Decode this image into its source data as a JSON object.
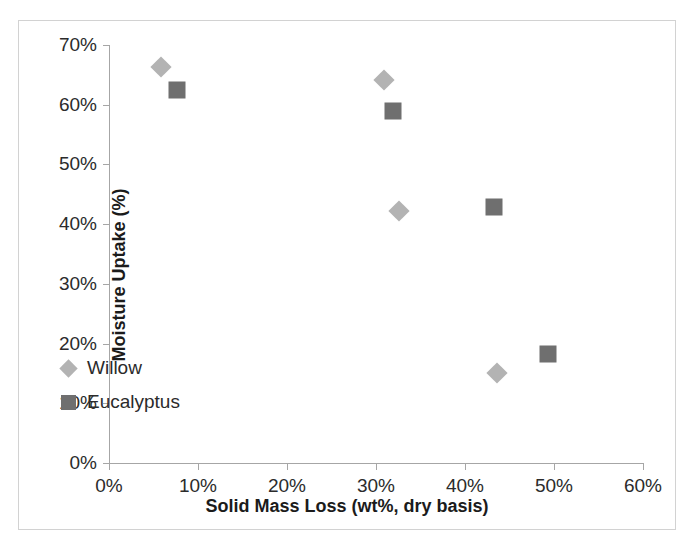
{
  "chart_data": {
    "type": "scatter",
    "title": "",
    "xlabel": "Solid Mass Loss (wt%, dry basis)",
    "ylabel": "Moisture Uptake (%)",
    "xlim": [
      0,
      60
    ],
    "ylim": [
      0,
      70
    ],
    "xticks": [
      "0%",
      "10%",
      "20%",
      "30%",
      "40%",
      "50%",
      "60%"
    ],
    "yticks": [
      "0%",
      "10%",
      "20%",
      "30%",
      "40%",
      "50%",
      "60%",
      "70%"
    ],
    "xtick_values": [
      0,
      10,
      20,
      30,
      40,
      50,
      60
    ],
    "ytick_values": [
      0,
      10,
      20,
      30,
      40,
      50,
      60,
      70
    ],
    "grid": false,
    "legend_position": "inside-lower-left",
    "series": [
      {
        "name": "Willow",
        "marker": "diamond",
        "color": "#b3b3b3",
        "points": [
          {
            "x": 5.8,
            "y": 66.3
          },
          {
            "x": 30.9,
            "y": 64.2
          },
          {
            "x": 32.6,
            "y": 42.2
          },
          {
            "x": 43.6,
            "y": 15.1
          }
        ]
      },
      {
        "name": "Eucalyptus",
        "marker": "square",
        "color": "#6f6f6f",
        "points": [
          {
            "x": 7.6,
            "y": 62.5
          },
          {
            "x": 31.9,
            "y": 58.9
          },
          {
            "x": 43.3,
            "y": 42.9
          },
          {
            "x": 49.3,
            "y": 18.3
          }
        ]
      }
    ]
  },
  "figure": {
    "border_color": "#d2d2d2",
    "axis_color": "#a6a6a6",
    "background": "#ffffff"
  }
}
